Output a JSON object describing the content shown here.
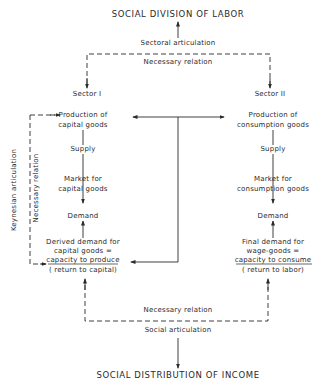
{
  "diagram": {
    "top_title": "SOCIAL DIVISION OF LABOR",
    "bottom_title": "SOCIAL DISTRIBUTION OF INCOME",
    "sectoral_articulation": "Sectoral articulation",
    "top_necessary_relation": "Necessary relation",
    "bottom_necessary_relation": "Necessary relation",
    "social_articulation": "Social articulation",
    "keynesian_articulation": "Keynesian articulation",
    "left_necessary_relation": "Necessary relation",
    "sector1": {
      "label": "Sector I",
      "production_line1": "Production of",
      "production_line2": "capital goods",
      "supply": "Supply",
      "market_line1": "Market for",
      "market_line2": "capital goods",
      "demand": "Demand",
      "derived_line1": "Derived demand for",
      "derived_line2": "capital goods =",
      "derived_line3": "capacity to produce",
      "derived_line4": "( return to capital)"
    },
    "sector2": {
      "label": "Sector II",
      "production_line1": "Production of",
      "production_line2": "consumption goods",
      "supply": "Supply",
      "market_line1": "Market for",
      "market_line2": "consumption goods",
      "demand": "Demand",
      "final_line1": "Final demand for",
      "final_line2": "wage-goods =",
      "final_line3": "capacity to consume",
      "final_line4": "( return to labor)"
    }
  }
}
